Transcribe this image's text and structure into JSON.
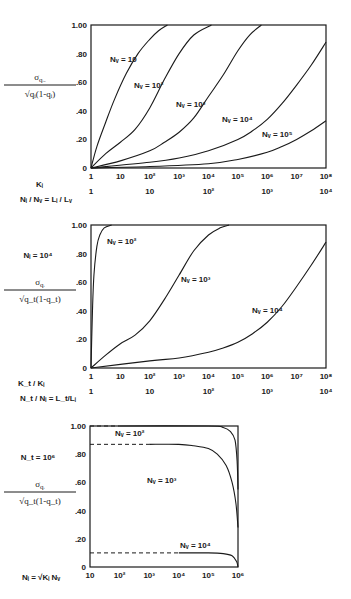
{
  "chart_data": [
    {
      "type": "line",
      "title": "",
      "ylabel": "σ_qiv / sqrt(q_i(1-q_i))",
      "xlabel": "K_i",
      "xlabel2": "N_i/N_v = L_i/L_v",
      "xscale": "log",
      "xlim": [
        1,
        100000000
      ],
      "ylim": [
        0,
        1.0
      ],
      "yticks": [
        "0",
        ".20",
        ".40",
        ".60",
        ".80",
        "1.00"
      ],
      "xticks": [
        "1",
        "10",
        "10²",
        "10³",
        "10⁴",
        "10⁵",
        "10⁶",
        "10⁷",
        "10⁸"
      ],
      "xticks2": [
        "1",
        "10",
        "10²",
        "10³",
        "10⁴"
      ],
      "grid": false,
      "series": [
        {
          "name": "Nᵥ = 10",
          "log10_x": [
            0,
            0.2,
            0.5,
            0.8,
            1.2,
            1.6,
            2.0,
            2.3,
            2.6
          ],
          "y": [
            0,
            0.15,
            0.32,
            0.48,
            0.66,
            0.8,
            0.9,
            0.96,
            1.0
          ]
        },
        {
          "name": "Nᵥ = 10²",
          "log10_x": [
            0,
            0.5,
            1.0,
            1.5,
            2.0,
            2.5,
            3.0,
            3.5,
            4.1
          ],
          "y": [
            0,
            0.1,
            0.18,
            0.27,
            0.42,
            0.62,
            0.8,
            0.93,
            1.0
          ]
        },
        {
          "name": "Nᵥ = 10³",
          "log10_x": [
            0,
            1.0,
            2.0,
            2.5,
            3.0,
            3.5,
            4.0,
            4.5,
            5.0,
            5.4,
            5.8
          ],
          "y": [
            0,
            0.05,
            0.12,
            0.18,
            0.25,
            0.35,
            0.5,
            0.65,
            0.82,
            0.93,
            1.0
          ]
        },
        {
          "name": "Nᵥ = 10⁴",
          "log10_x": [
            0,
            2.0,
            3.0,
            4.0,
            5.0,
            5.5,
            6.0,
            6.5,
            7.0,
            7.5,
            8.0
          ],
          "y": [
            0,
            0.04,
            0.07,
            0.12,
            0.2,
            0.26,
            0.34,
            0.45,
            0.58,
            0.72,
            0.88
          ]
        },
        {
          "name": "Nᵥ = 10⁵",
          "log10_x": [
            0,
            2.0,
            4.0,
            5.0,
            6.0,
            6.5,
            7.0,
            7.5,
            8.0
          ],
          "y": [
            0,
            0.01,
            0.03,
            0.06,
            0.11,
            0.15,
            0.2,
            0.26,
            0.33
          ]
        }
      ],
      "annotations": [
        "Nᵥ = 10",
        "Nᵥ = 10²",
        "Nᵥ = 10³",
        "Nᵥ = 10⁴",
        "Nᵥ = 10⁵"
      ]
    },
    {
      "type": "line",
      "title": "",
      "ylabel": "σ_qi / sqrt(q_t(1-q_t))",
      "annotation_param": "Nᵢ = 10⁴",
      "xlabel": "K_t/K_i",
      "xlabel2": "N_t/N_i = L_t/L_i",
      "xscale": "log",
      "xlim": [
        1,
        100000000
      ],
      "ylim": [
        0,
        1.0
      ],
      "yticks": [
        "0",
        ".20",
        ".40",
        ".60",
        ".80",
        "1.00"
      ],
      "xticks": [
        "1",
        "10",
        "10²",
        "10³",
        "10⁴",
        "10⁵",
        "10⁶",
        "10⁷",
        "10⁸"
      ],
      "xticks2": [
        "1",
        "10",
        "10²",
        "10³",
        "10⁴"
      ],
      "grid": false,
      "series": [
        {
          "name": "Nᵥ = 10²",
          "log10_x": [
            0,
            0.05,
            0.1,
            0.2,
            0.3,
            0.45,
            0.7
          ],
          "y": [
            0,
            0.4,
            0.65,
            0.85,
            0.93,
            0.98,
            1.0
          ]
        },
        {
          "name": "Nᵥ = 10³",
          "log10_x": [
            0,
            0.5,
            1.0,
            1.5,
            2.0,
            2.5,
            3.0,
            3.5,
            4.0,
            4.4,
            4.7
          ],
          "y": [
            0,
            0.09,
            0.17,
            0.23,
            0.33,
            0.48,
            0.65,
            0.82,
            0.93,
            0.98,
            1.0
          ]
        },
        {
          "name": "Nᵥ = 10⁴",
          "log10_x": [
            0,
            2.0,
            3.0,
            4.0,
            4.5,
            5.0,
            5.5,
            6.0,
            6.5,
            7.0,
            7.5,
            8.0
          ],
          "y": [
            0,
            0.05,
            0.07,
            0.11,
            0.14,
            0.18,
            0.24,
            0.32,
            0.43,
            0.57,
            0.72,
            0.88
          ]
        }
      ],
      "annotations": [
        "Nᵥ = 10²",
        "Nᵥ = 10³",
        "Nᵥ = 10⁴"
      ]
    },
    {
      "type": "line",
      "title": "",
      "ylabel": "σ_qi / sqrt(q_t(1-q_t))",
      "annotation_param": "N_t = 10⁶",
      "xlabel": "N_i = sqrt(K_i) N_v",
      "xscale": "log",
      "xlim": [
        10,
        1000000
      ],
      "ylim": [
        0,
        1.0
      ],
      "yticks": [
        "0",
        ".20",
        ".40",
        ".60",
        ".80",
        "1.00"
      ],
      "xticks": [
        "10",
        "10²",
        "10³",
        "10⁴",
        "10⁵",
        "10⁶"
      ],
      "grid": false,
      "series": [
        {
          "name": "Nᵥ = 10²",
          "dashed_until_log10_x": 2.0,
          "log10_x": [
            1.0,
            2.0,
            5.0,
            5.5,
            5.75,
            5.9,
            5.97,
            6.0
          ],
          "y": [
            1.0,
            1.0,
            1.0,
            0.99,
            0.96,
            0.9,
            0.75,
            0.55
          ]
        },
        {
          "name": "Nᵥ = 10³",
          "dashed_until_log10_x": 3.0,
          "log10_x": [
            1.0,
            3.0,
            4.0,
            4.5,
            5.0,
            5.3,
            5.6,
            5.8,
            5.93,
            6.0
          ],
          "y": [
            0.87,
            0.87,
            0.87,
            0.86,
            0.84,
            0.8,
            0.72,
            0.6,
            0.45,
            0.28
          ]
        },
        {
          "name": "Nᵥ = 10⁴",
          "dashed_until_log10_x": 4.0,
          "log10_x": [
            1.0,
            4.0,
            5.0,
            5.5,
            5.8,
            5.95,
            6.0
          ],
          "y": [
            0.1,
            0.1,
            0.1,
            0.095,
            0.08,
            0.04,
            0.0
          ]
        }
      ],
      "annotations": [
        "Nᵥ = 10²",
        "Nᵥ = 10³",
        "Nᵥ = 10⁴"
      ]
    }
  ],
  "labels": {
    "c1": {
      "ylab_num": "σ",
      "ylab_sub": "qᵢᵥ",
      "ylab_den": "√qᵢ(1-qᵢ)",
      "xlab1": "Kᵢ",
      "xlab2": "Nᵢ / Nᵥ = Lᵢ / Lᵥ"
    },
    "c2": {
      "param": "Nᵢ = 10⁴",
      "ylab_num": "σ",
      "ylab_sub": "qᵢ",
      "ylab_den": "√q_t(1-q_t)",
      "xlab1": "K_t / Kᵢ",
      "xlab2": "N_t / Nᵢ = L_t/Lᵢ"
    },
    "c3": {
      "param": "N_t = 10⁶",
      "ylab_num": "σ",
      "ylab_sub": "qᵢ",
      "ylab_den": "√q_t(1-q_t)",
      "xlab1": "Nᵢ = √Kᵢ Nᵥ"
    }
  }
}
